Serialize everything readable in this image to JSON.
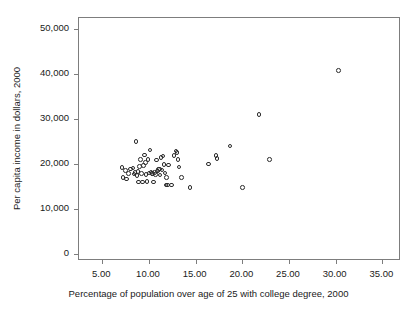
{
  "chart_data": {
    "type": "scatter",
    "title": "",
    "xlabel": "Percentage of population over age of 25 with college degree, 2000",
    "ylabel": "Per capita income in dollars, 2000",
    "xlim": [
      2.5,
      37.0
    ],
    "ylim": [
      -1500,
      52500
    ],
    "xticks": [
      5.0,
      10.0,
      15.0,
      20.0,
      25.0,
      30.0,
      35.0
    ],
    "xtick_labels": [
      "5.00",
      "10.00",
      "15.00",
      "20.00",
      "25.00",
      "30.00",
      "35.00"
    ],
    "yticks": [
      0,
      10000,
      20000,
      30000,
      40000,
      50000
    ],
    "ytick_labels": [
      "0",
      "10,000",
      "20,000",
      "30,000",
      "40,000",
      "50,000"
    ],
    "grid": false,
    "legend": null,
    "marker": "open-circle",
    "marker_color": "#2b2b2b",
    "n_points": 61,
    "points": [
      {
        "x": 7.1,
        "y": 19300
      },
      {
        "x": 7.2,
        "y": 17000
      },
      {
        "x": 7.5,
        "y": 18600
      },
      {
        "x": 7.6,
        "y": 16700
      },
      {
        "x": 7.8,
        "y": 17900
      },
      {
        "x": 8.0,
        "y": 18900
      },
      {
        "x": 8.3,
        "y": 19200
      },
      {
        "x": 8.4,
        "y": 17800
      },
      {
        "x": 8.5,
        "y": 18200
      },
      {
        "x": 8.6,
        "y": 25100
      },
      {
        "x": 8.7,
        "y": 17500
      },
      {
        "x": 8.8,
        "y": 18400
      },
      {
        "x": 8.9,
        "y": 16100
      },
      {
        "x": 9.0,
        "y": 19500
      },
      {
        "x": 9.1,
        "y": 21000
      },
      {
        "x": 9.2,
        "y": 18000
      },
      {
        "x": 9.3,
        "y": 16100
      },
      {
        "x": 9.4,
        "y": 19700
      },
      {
        "x": 9.5,
        "y": 22100
      },
      {
        "x": 9.6,
        "y": 20400
      },
      {
        "x": 9.7,
        "y": 17700
      },
      {
        "x": 9.8,
        "y": 16200
      },
      {
        "x": 9.9,
        "y": 21000
      },
      {
        "x": 10.0,
        "y": 18100
      },
      {
        "x": 10.1,
        "y": 23200
      },
      {
        "x": 10.2,
        "y": 18300
      },
      {
        "x": 10.3,
        "y": 17900
      },
      {
        "x": 10.4,
        "y": 18000
      },
      {
        "x": 10.5,
        "y": 16100
      },
      {
        "x": 10.6,
        "y": 18200
      },
      {
        "x": 10.7,
        "y": 17700
      },
      {
        "x": 10.8,
        "y": 20900
      },
      {
        "x": 10.9,
        "y": 18500
      },
      {
        "x": 11.0,
        "y": 18800
      },
      {
        "x": 11.1,
        "y": 18900
      },
      {
        "x": 11.2,
        "y": 17600
      },
      {
        "x": 11.3,
        "y": 21500
      },
      {
        "x": 11.4,
        "y": 18700
      },
      {
        "x": 11.5,
        "y": 21800
      },
      {
        "x": 11.6,
        "y": 19900
      },
      {
        "x": 11.7,
        "y": 18100
      },
      {
        "x": 11.8,
        "y": 15400
      },
      {
        "x": 11.9,
        "y": 17000
      },
      {
        "x": 12.0,
        "y": 15400
      },
      {
        "x": 12.1,
        "y": 19800
      },
      {
        "x": 12.4,
        "y": 15400
      },
      {
        "x": 12.7,
        "y": 22000
      },
      {
        "x": 12.9,
        "y": 22900
      },
      {
        "x": 13.0,
        "y": 22600
      },
      {
        "x": 13.1,
        "y": 21000
      },
      {
        "x": 13.2,
        "y": 19400
      },
      {
        "x": 13.5,
        "y": 17000
      },
      {
        "x": 14.4,
        "y": 14800
      },
      {
        "x": 16.4,
        "y": 20100
      },
      {
        "x": 17.2,
        "y": 21900
      },
      {
        "x": 17.3,
        "y": 21300
      },
      {
        "x": 18.7,
        "y": 24100
      },
      {
        "x": 20.0,
        "y": 14800
      },
      {
        "x": 21.8,
        "y": 31000
      },
      {
        "x": 22.9,
        "y": 21000
      },
      {
        "x": 30.3,
        "y": 40800
      }
    ]
  },
  "figure": {
    "background": "#ffffff",
    "frame_color": "#7d7d7d",
    "text_color": "#1a1a1a"
  }
}
